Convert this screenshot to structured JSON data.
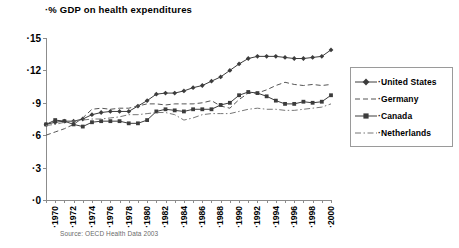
{
  "chart_data": {
    "type": "line",
    "title": "·% GDP on health expenditures",
    "xlabel": "",
    "ylabel": "",
    "ylim": [
      0,
      15
    ],
    "xlim": [
      1970,
      2001
    ],
    "grid": false,
    "legend_position": "right",
    "source": "Source: OECD Health Data 2003",
    "y_ticks": [
      "·0",
      "·3",
      "·6",
      "·9",
      "·12",
      "·15"
    ],
    "y_tick_values": [
      0,
      3,
      6,
      9,
      12,
      15
    ],
    "x": [
      1970,
      1971,
      1972,
      1973,
      1974,
      1975,
      1976,
      1977,
      1978,
      1979,
      1980,
      1981,
      1982,
      1983,
      1984,
      1985,
      1986,
      1987,
      1988,
      1989,
      1990,
      1991,
      1992,
      1993,
      1994,
      1995,
      1996,
      1997,
      1998,
      1999,
      2000,
      2001
    ],
    "x_tick_labels": [
      "·1970",
      "·1972",
      "·1974",
      "·1976",
      "·1978",
      "·1980",
      "·1982",
      "·1984",
      "·1986",
      "·1988",
      "·1990",
      "·1992",
      "·1994",
      "·1996",
      "·1998",
      "·2000"
    ],
    "x_tick_values": [
      1970,
      1972,
      1974,
      1976,
      1978,
      1980,
      1982,
      1984,
      1986,
      1988,
      1990,
      1992,
      1994,
      1996,
      1998,
      2000
    ],
    "series": [
      {
        "name": "·United States",
        "marker": "diamond",
        "line_style": "solid",
        "color": "#3c3c3c",
        "values": [
          7.0,
          7.2,
          7.3,
          7.3,
          7.5,
          7.9,
          8.1,
          8.2,
          8.2,
          8.2,
          8.7,
          9.2,
          9.8,
          9.9,
          9.9,
          10.1,
          10.4,
          10.6,
          11.0,
          11.4,
          12.0,
          12.6,
          13.1,
          13.3,
          13.3,
          13.3,
          13.2,
          13.1,
          13.1,
          13.2,
          13.3,
          13.9
        ]
      },
      {
        "name": "·Germany",
        "marker": "none",
        "line_style": "dashed",
        "color": "#555555",
        "values": [
          6.0,
          6.3,
          6.6,
          7.0,
          7.6,
          8.4,
          8.5,
          8.4,
          8.5,
          8.5,
          8.7,
          8.9,
          8.9,
          8.8,
          8.9,
          8.9,
          8.9,
          9.0,
          9.2,
          8.7,
          8.5,
          9.3,
          9.9,
          9.9,
          10.2,
          10.6,
          10.9,
          10.7,
          10.6,
          10.7,
          10.6,
          10.7
        ]
      },
      {
        "name": "·Canada",
        "marker": "square",
        "line_style": "solid",
        "color": "#3c3c3c",
        "values": [
          7.0,
          7.4,
          7.3,
          7.0,
          6.8,
          7.2,
          7.3,
          7.3,
          7.3,
          7.1,
          7.1,
          7.4,
          8.2,
          8.4,
          8.3,
          8.2,
          8.4,
          8.4,
          8.4,
          8.8,
          9.0,
          9.7,
          10.0,
          9.9,
          9.6,
          9.2,
          8.9,
          8.9,
          9.1,
          9.0,
          9.1,
          9.7
        ]
      },
      {
        "name": "·Netherlands",
        "marker": "none",
        "line_style": "dashdot",
        "color": "#777777",
        "values": [
          6.9,
          7.0,
          7.2,
          7.3,
          7.4,
          7.5,
          7.5,
          7.6,
          7.7,
          7.9,
          7.9,
          8.0,
          8.1,
          8.1,
          7.9,
          7.4,
          7.6,
          7.9,
          8.0,
          8.0,
          8.0,
          8.2,
          8.4,
          8.5,
          8.4,
          8.4,
          8.3,
          8.3,
          8.4,
          8.5,
          8.6,
          8.9
        ]
      }
    ]
  }
}
